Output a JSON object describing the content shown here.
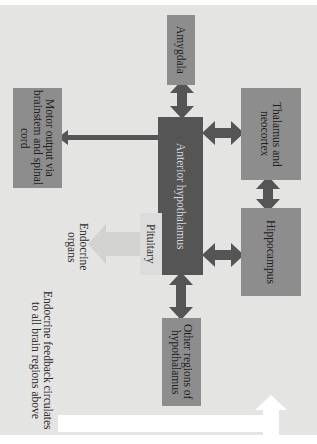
{
  "diagram": {
    "orientation": "rotated 90deg clockwise",
    "colors": {
      "background": "#e4e4e2",
      "box_mid": "#8d8d8d",
      "box_dark": "#555555",
      "box_light": "#dcdcdc",
      "arrow": "#555555",
      "feedback_arrow": "#ffffff"
    },
    "nodes": {
      "amygdala": "Amygdala",
      "thalamus": "Thalamus and neocortex",
      "hippocampus": "Hippocampus",
      "anterior": "Anterior hypothalamus",
      "motor": "Motor output via brainstem and spinal cord",
      "pituitary": "Pituitary",
      "other": "Other regions of hypothalamus",
      "endocrine": "Endocrine organs"
    },
    "feedback_label": "Endocrine feedback circulates to all brain regions above",
    "edges": [
      {
        "from": "amygdala",
        "to": "anterior",
        "type": "bidirectional"
      },
      {
        "from": "thalamus",
        "to": "anterior",
        "type": "bidirectional"
      },
      {
        "from": "hippocampus",
        "to": "anterior",
        "type": "bidirectional"
      },
      {
        "from": "thalamus",
        "to": "hippocampus",
        "type": "bidirectional"
      },
      {
        "from": "other",
        "to": "anterior",
        "type": "bidirectional"
      },
      {
        "from": "anterior",
        "to": "motor",
        "type": "directed"
      },
      {
        "from": "anterior",
        "to": "pituitary",
        "type": "directed"
      },
      {
        "from": "pituitary",
        "to": "endocrine",
        "type": "directed"
      },
      {
        "from": "endocrine",
        "to": "all",
        "type": "feedback"
      }
    ]
  }
}
